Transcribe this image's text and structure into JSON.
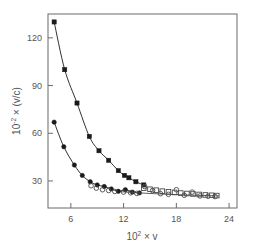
{
  "chart_data": {
    "type": "line",
    "title": "",
    "xlabel": "10² × v",
    "xlabel_base": "10",
    "xlabel_exp": "2",
    "xlabel_rest": " × v",
    "ylabel": "10⁻² × (v/c)",
    "ylabel_base": "10",
    "ylabel_exp": "-2",
    "ylabel_rest": " × (v/c)",
    "xlim": [
      3.4,
      24.9
    ],
    "ylim": [
      13.0,
      135.0
    ],
    "xticks": [
      6,
      12,
      18,
      24
    ],
    "xtick_labels": [
      "6",
      "12",
      "18",
      "24"
    ],
    "yticks": [
      30,
      60,
      90,
      120
    ],
    "ytick_labels": [
      "30",
      "60",
      "90",
      "120"
    ],
    "grid": false,
    "legend": "none",
    "frame": true,
    "series": [
      {
        "name": "upper-branch-filled-squares",
        "marker": "filled-square",
        "color": "#1a1a1a",
        "has_line": true,
        "x": [
          4.1,
          5.3,
          6.7,
          8.1,
          9.2,
          10.3,
          11.4,
          12.1,
          12.6,
          13.4,
          14.3
        ],
        "y": [
          130.0,
          100.0,
          79.0,
          58.0,
          49.0,
          43.0,
          36.5,
          33.5,
          32.0,
          29.5,
          27.5
        ]
      },
      {
        "name": "lower-branch-filled-circles",
        "marker": "filled-circle",
        "color": "#1a1a1a",
        "has_line": true,
        "x": [
          4.1,
          5.2,
          6.4,
          7.3,
          8.2,
          9.0,
          9.8,
          10.6,
          11.4,
          12.2,
          13.0,
          13.8
        ],
        "y": [
          67.0,
          51.5,
          40.0,
          33.5,
          29.5,
          27.5,
          26.5,
          25.0,
          23.5,
          24.5,
          23.0,
          22.5
        ]
      },
      {
        "name": "tail-open-squares",
        "marker": "open-square",
        "color": "#4a4a4a",
        "has_line": false,
        "x": [
          14.3,
          15.0,
          15.7,
          16.4,
          17.1,
          17.8,
          18.5,
          19.2,
          19.9,
          20.6,
          21.3,
          22.0,
          22.6
        ],
        "y": [
          25.5,
          24.8,
          24.2,
          23.6,
          23.2,
          22.8,
          22.4,
          22.1,
          21.8,
          21.5,
          21.2,
          21.0,
          20.8
        ]
      },
      {
        "name": "tail-open-circles",
        "marker": "open-circle",
        "color": "#4a4a4a",
        "has_line": false,
        "x": [
          8.3,
          8.9,
          9.6,
          10.3,
          11.0,
          12.0,
          12.8,
          13.5,
          14.4,
          15.3,
          16.2,
          17.1,
          18.0,
          18.9,
          19.8,
          20.7,
          21.6,
          22.4
        ],
        "y": [
          27.0,
          25.5,
          24.5,
          24.0,
          23.4,
          23.0,
          22.6,
          22.2,
          26.5,
          24.0,
          22.0,
          21.6,
          24.5,
          21.0,
          23.0,
          20.6,
          20.4,
          20.2
        ]
      },
      {
        "name": "tail-guide-curve",
        "marker": "none",
        "color": "#4a4a4a",
        "has_line": true,
        "x": [
          11.8,
          13.5,
          15.5,
          17.5,
          19.5,
          21.5,
          22.8
        ],
        "y": [
          23.2,
          22.6,
          22.0,
          21.5,
          21.1,
          20.8,
          20.6
        ]
      }
    ]
  }
}
